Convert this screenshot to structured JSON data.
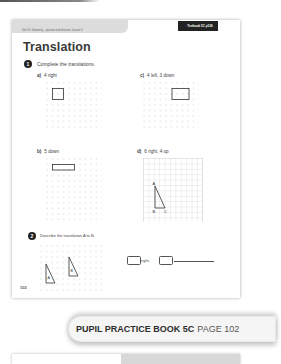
{
  "header": {
    "unit": "Unit 10: Geometry – position and direction, Lesson 3",
    "textbook_ref": "→ Textbook 5C p126"
  },
  "title": "Translation",
  "questions": [
    {
      "number": "1",
      "text": "Complete the translations.",
      "parts": [
        {
          "label": "a)",
          "text": "4 right",
          "shape": "square"
        },
        {
          "label": "b)",
          "text": "5 down",
          "shape": "rectangle"
        },
        {
          "label": "c)",
          "text": "4 left, 3 down",
          "shape": "rectangle"
        },
        {
          "label": "d)",
          "text": "6 right, 4 up",
          "shape": "triangle",
          "vertices": [
            "A",
            "B",
            "C"
          ]
        }
      ]
    },
    {
      "number": "2",
      "text": "Describe the translation A to B.",
      "shape_labels": [
        "A",
        "B"
      ],
      "answer": {
        "word_right": "right,",
        "box1": "",
        "box2": ""
      }
    }
  ],
  "page_number": "102",
  "banner": {
    "book": "PUPIL PRACTICE BOOK 5C",
    "page": "PAGE 102"
  }
}
